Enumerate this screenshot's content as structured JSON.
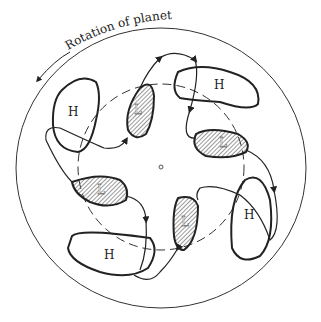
{
  "diagram": {
    "caption_top": "Rotation of planet",
    "labels": {
      "high": "H",
      "low": "L"
    },
    "highs": [
      {
        "label": "H",
        "x": 72,
        "y": 112
      },
      {
        "label": "H",
        "x": 218,
        "y": 85
      },
      {
        "label": "H",
        "x": 108,
        "y": 255
      },
      {
        "label": "H",
        "x": 248,
        "y": 215
      }
    ],
    "lows": [
      {
        "label": "L",
        "x": 138,
        "y": 110
      },
      {
        "label": "L",
        "x": 223,
        "y": 143
      },
      {
        "label": "L",
        "x": 101,
        "y": 190
      },
      {
        "label": "L",
        "x": 185,
        "y": 222
      }
    ],
    "colors": {
      "line": "#222222",
      "hatch": "#555555",
      "background": "#ffffff"
    }
  }
}
